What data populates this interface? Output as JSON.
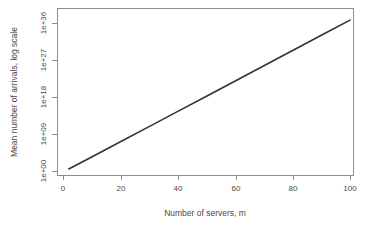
{
  "chart_data": {
    "type": "line",
    "title": "",
    "xlabel": "Number of servers, m",
    "ylabel": "Mean number of arrivals, log scale",
    "x_ticks": [
      0,
      20,
      40,
      60,
      80,
      100
    ],
    "x_tick_labels": [
      "0",
      "20",
      "40",
      "60",
      "80",
      "100"
    ],
    "y_ticks": [
      1,
      1000000000.0,
      1e+18,
      1e+27,
      1e+36
    ],
    "y_tick_labels": [
      "1e+00",
      "1e+09",
      "1e+18",
      "1e+27",
      "1e+36"
    ],
    "xlim": [
      0,
      103
    ],
    "ylim": [
      1,
      1e+38
    ],
    "y_scale": "log",
    "grid": false,
    "legend": null,
    "series": [
      {
        "name": "Mean number of arrivals",
        "color": "#333333",
        "x": [
          2,
          10,
          20,
          30,
          40,
          50,
          60,
          70,
          80,
          90,
          100
        ],
        "y": [
          3.0,
          1000.0,
          10000000.0,
          100000000000.0,
          1000000000000000.0,
          1e+19,
          1e+23,
          1e+27,
          1e+31,
          1e+34,
          1e+37
        ],
        "y_exponents": [
          0.5,
          3.4,
          7.1,
          10.8,
          14.5,
          18.2,
          21.9,
          25.6,
          29.3,
          33.0,
          36.7
        ]
      }
    ]
  },
  "axes": {
    "x_title": "Number of servers, m",
    "y_title": "Mean number of arrivals, log scale"
  },
  "ticks": {
    "x": [
      "0",
      "20",
      "40",
      "60",
      "80",
      "100"
    ],
    "y": [
      "1e+36",
      "1e+27",
      "1e+18",
      "1e+09",
      "1e+00"
    ]
  },
  "colors": {
    "line": "#333333",
    "axis": "#8c8c8c",
    "text": "#4a4a4a",
    "background": "#ffffff"
  }
}
